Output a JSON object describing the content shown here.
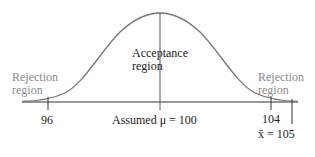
{
  "diagram": {
    "type": "normal-curve-hypothesis-test",
    "colors": {
      "curve": "#777777",
      "axis": "#333333",
      "rejection_text": "#8a8a8a",
      "text": "#222222"
    },
    "labels": {
      "acceptance_line1": "Acceptance",
      "acceptance_line2": "region",
      "rejection_left_line1": "Rejection",
      "rejection_left_line2": "region",
      "rejection_right_line1": "Rejection",
      "rejection_right_line2": "region"
    },
    "ticks": {
      "left": "96",
      "mean": "Assumed μ = 100",
      "right": "104",
      "sample": "x̄ = 105"
    }
  }
}
